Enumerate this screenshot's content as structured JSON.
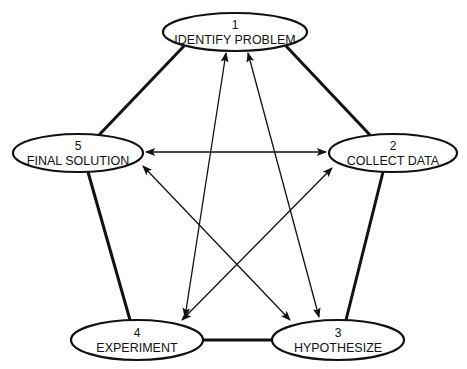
{
  "diagram": {
    "type": "pentagon-process-cycle",
    "nodes": [
      {
        "id": "1",
        "number": "1",
        "label": "IDENTIFY PROBLEM",
        "cx": 235,
        "cy": 32,
        "rx": 72,
        "ry": 19
      },
      {
        "id": "2",
        "number": "2",
        "label": "COLLECT DATA",
        "cx": 393,
        "cy": 153,
        "rx": 64,
        "ry": 19
      },
      {
        "id": "3",
        "number": "3",
        "label": "HYPOTHESIZE",
        "cx": 338,
        "cy": 340,
        "rx": 66,
        "ry": 20
      },
      {
        "id": "4",
        "number": "4",
        "label": "EXPERIMENT",
        "cx": 137,
        "cy": 340,
        "rx": 66,
        "ry": 20
      },
      {
        "id": "5",
        "number": "5",
        "label": "FINAL SOLUTION",
        "cx": 78,
        "cy": 153,
        "rx": 65,
        "ry": 19
      }
    ],
    "thick_edges": [
      {
        "from": "1",
        "to": "2"
      },
      {
        "from": "2",
        "to": "3"
      },
      {
        "from": "3",
        "to": "4"
      },
      {
        "from": "4",
        "to": "5"
      },
      {
        "from": "5",
        "to": "1"
      }
    ],
    "arrow_edges": [
      {
        "from": "1",
        "to": "4",
        "bidirectional": true
      },
      {
        "from": "1",
        "to": "3",
        "bidirectional": true
      },
      {
        "from": "5",
        "to": "2",
        "bidirectional": true
      },
      {
        "from": "5",
        "to": "3",
        "bidirectional": true
      },
      {
        "from": "2",
        "to": "4",
        "bidirectional": true
      }
    ],
    "colors": {
      "stroke": "#111111",
      "fill": "#ffffff"
    }
  }
}
